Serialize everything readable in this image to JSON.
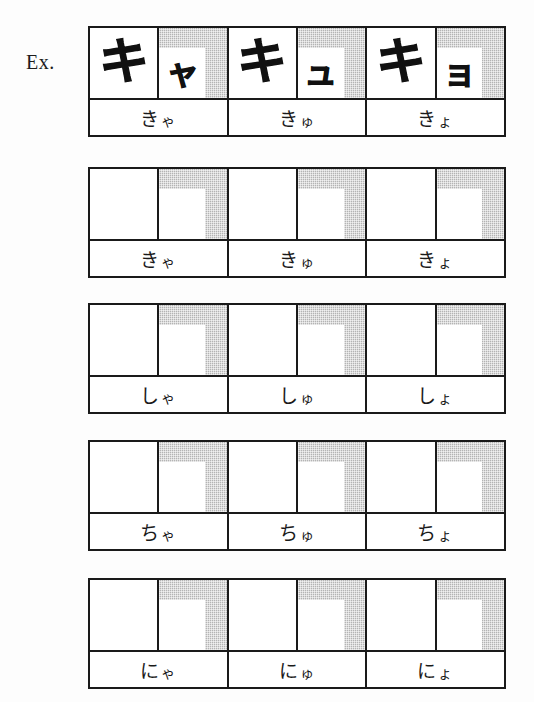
{
  "worksheet": {
    "example_label": "Ex.",
    "colors": {
      "ink": "#1a1a1a",
      "shading": "#b4b4b4",
      "paper": "#ffffff"
    },
    "rows": [
      {
        "is_example": true,
        "groups": [
          {
            "main_kana": "キ",
            "small_kana": "ャ",
            "reading_lead": "き",
            "reading_sub": "ゃ"
          },
          {
            "main_kana": "キ",
            "small_kana": "ュ",
            "reading_lead": "き",
            "reading_sub": "ゅ"
          },
          {
            "main_kana": "キ",
            "small_kana": "ョ",
            "reading_lead": "き",
            "reading_sub": "ょ"
          }
        ]
      },
      {
        "is_example": false,
        "groups": [
          {
            "main_kana": "",
            "small_kana": "",
            "reading_lead": "き",
            "reading_sub": "ゃ"
          },
          {
            "main_kana": "",
            "small_kana": "",
            "reading_lead": "き",
            "reading_sub": "ゅ"
          },
          {
            "main_kana": "",
            "small_kana": "",
            "reading_lead": "き",
            "reading_sub": "ょ"
          }
        ]
      },
      {
        "is_example": false,
        "groups": [
          {
            "main_kana": "",
            "small_kana": "",
            "reading_lead": "し",
            "reading_sub": "ゃ"
          },
          {
            "main_kana": "",
            "small_kana": "",
            "reading_lead": "し",
            "reading_sub": "ゅ"
          },
          {
            "main_kana": "",
            "small_kana": "",
            "reading_lead": "し",
            "reading_sub": "ょ"
          }
        ]
      },
      {
        "is_example": false,
        "groups": [
          {
            "main_kana": "",
            "small_kana": "",
            "reading_lead": "ち",
            "reading_sub": "ゃ"
          },
          {
            "main_kana": "",
            "small_kana": "",
            "reading_lead": "ち",
            "reading_sub": "ゅ"
          },
          {
            "main_kana": "",
            "small_kana": "",
            "reading_lead": "ち",
            "reading_sub": "ょ"
          }
        ]
      },
      {
        "is_example": false,
        "groups": [
          {
            "main_kana": "",
            "small_kana": "",
            "reading_lead": "に",
            "reading_sub": "ゃ"
          },
          {
            "main_kana": "",
            "small_kana": "",
            "reading_lead": "に",
            "reading_sub": "ゅ"
          },
          {
            "main_kana": "",
            "small_kana": "",
            "reading_lead": "に",
            "reading_sub": "ょ"
          }
        ]
      }
    ],
    "row_tops": [
      26,
      167,
      303,
      440,
      578
    ]
  }
}
